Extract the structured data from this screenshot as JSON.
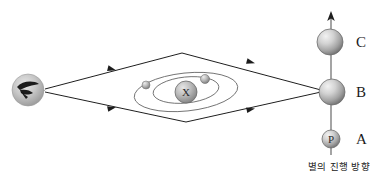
{
  "figure": {
    "caption": "별의 진행 방향",
    "background_color": "#ffffff",
    "line_color": "#1f1f1f",
    "orbit_color": "#6b6b6b"
  },
  "observer": {
    "name": "observer-eye",
    "icon": "eye-icon",
    "x": 28,
    "y": 90,
    "radius": 16
  },
  "center": {
    "name": "central-sphere",
    "glyph": "X",
    "x": 186,
    "y": 92,
    "radius": 11
  },
  "orbiting_bodies": [
    {
      "name": "outer-orbit-body",
      "glyph": "",
      "x": 146,
      "y": 85,
      "radius": 4
    },
    {
      "name": "inner-orbit-body",
      "glyph": "",
      "x": 205,
      "y": 79,
      "radius": 4.5
    }
  ],
  "orbits": [
    {
      "name": "outer-orbit",
      "cx": 186,
      "cy": 92,
      "rx": 52,
      "ry": 19,
      "rotation": -6
    },
    {
      "name": "inner-orbit",
      "cx": 186,
      "cy": 90,
      "rx": 33,
      "ry": 13,
      "rotation": -6
    }
  ],
  "star_positions": [
    {
      "id": "C",
      "label": "C",
      "glyph": "",
      "x": 330,
      "y": 42,
      "radius": 13
    },
    {
      "id": "B",
      "label": "B",
      "glyph": "",
      "x": 332,
      "y": 92,
      "radius": 13
    },
    {
      "id": "A",
      "label": "A",
      "glyph": "P",
      "x": 331,
      "y": 139,
      "radius": 9
    }
  ],
  "position_labels": [
    {
      "text": "C",
      "x": 358,
      "y": 47
    },
    {
      "text": "B",
      "x": 358,
      "y": 97
    },
    {
      "text": "A",
      "x": 358,
      "y": 144
    }
  ],
  "motion_arrow": {
    "name": "star-motion-arrow",
    "direction": "up",
    "from_y": 155,
    "to_y": 12,
    "x": 331
  },
  "light_path": {
    "name": "parallax-light-path",
    "description": "Diamond-shaped light ray path from star B to observer",
    "vertices": [
      {
        "x": 44,
        "y": 90
      },
      {
        "x": 182,
        "y": 53
      },
      {
        "x": 320,
        "y": 90
      },
      {
        "x": 186,
        "y": 122
      }
    ],
    "arrow_marks": [
      {
        "x": 118,
        "y": 71,
        "angle": 195
      },
      {
        "x": 256,
        "y": 66,
        "angle": 195
      },
      {
        "x": 118,
        "y": 109,
        "angle": 165
      },
      {
        "x": 256,
        "y": 113,
        "angle": 165
      },
      {
        "x": 50,
        "y": 90,
        "angle": 180
      }
    ]
  }
}
